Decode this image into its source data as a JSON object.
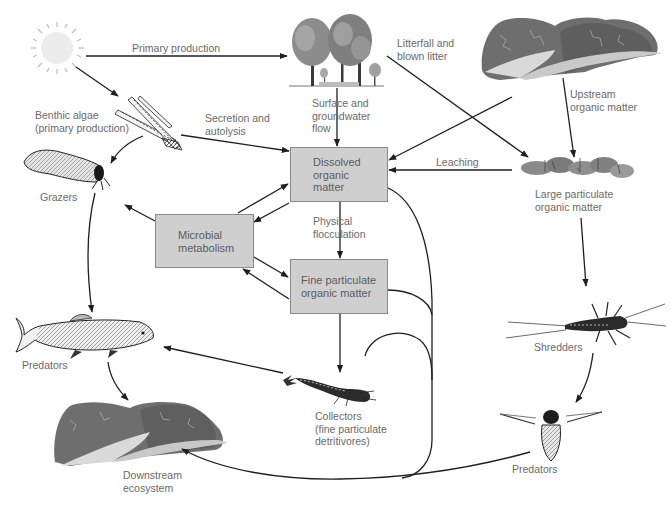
{
  "diagram": {
    "nodes": {
      "sun": {
        "icon": "sun-icon"
      },
      "trees": {
        "icon": "trees-icon"
      },
      "upstream_landscape": {
        "icon": "mountain-stream-icon"
      },
      "benthic_algae": {
        "icon": "algae-icon",
        "label": "Benthic algae\n(primary production)"
      },
      "grazers": {
        "icon": "caddisfly-case-icon",
        "label": "Grazers"
      },
      "fish_predators": {
        "icon": "trout-icon",
        "label": "Predators"
      },
      "downstream": {
        "icon": "downstream-landscape-icon",
        "label": "Downstream\necosystem"
      },
      "collectors": {
        "icon": "larva-icon",
        "label": "Collectors\n(fine particulate\ndetritivores)"
      },
      "lpom": {
        "icon": "leaf-litter-icon",
        "label": "Large particulate\norganic matter"
      },
      "shredders": {
        "icon": "stonefly-nymph-icon",
        "label": "Shredders"
      },
      "insect_predators": {
        "icon": "water-beetle-icon",
        "label": "Predators"
      }
    },
    "boxes": {
      "dom": "Dissolved\norganic\nmatter",
      "microbial": "Microbial\nmetabolism",
      "fpom": "Fine particulate\norganic matter"
    },
    "edge_labels": {
      "primary_production": "Primary production",
      "litterfall": "Litterfall and\nblown litter",
      "upstream_om": "Upstream\norganic matter",
      "secretion": "Secretion and\nautolysis",
      "surface_flow": "Surface and\ngroundwater\nflow",
      "leaching": "Leaching",
      "flocculation": "Physical\nflocculation"
    },
    "colors": {
      "box_fill": "#cfcfcf",
      "box_border": "#8a8a8a",
      "arrow": "#1e1e1e",
      "label_text": "#6a6a6a"
    }
  }
}
